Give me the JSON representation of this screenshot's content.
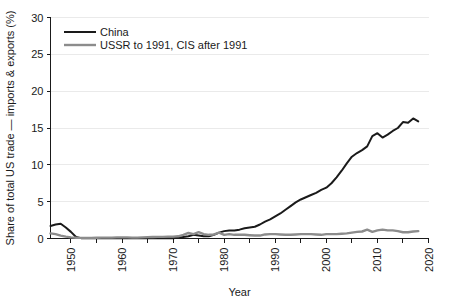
{
  "chart_data": {
    "type": "line",
    "title": "",
    "xlabel": "Year",
    "ylabel": "Share of total US trade — imports & exports (%)",
    "xlim": [
      1946,
      2020
    ],
    "ylim": [
      0,
      30
    ],
    "xticks": [
      1950,
      1960,
      1970,
      1980,
      1990,
      2000,
      2010,
      2020
    ],
    "xtick_labels": [
      "1950",
      "1960",
      "1970",
      "1980",
      "1990",
      "2000",
      "2010",
      "2020"
    ],
    "xminor_ticks": [
      1955,
      1965,
      1975,
      1985,
      1995,
      2005,
      2015
    ],
    "yticks": [
      0,
      5,
      10,
      15,
      20,
      25,
      30
    ],
    "ytick_labels": [
      "0",
      "5",
      "10",
      "15",
      "20",
      "25",
      "30"
    ],
    "grid": "y-major-faint",
    "legend_position": "top-left-inside",
    "series": [
      {
        "name": "China",
        "color": "#1a1a1a",
        "width": 2.0,
        "x": [
          1946,
          1947,
          1948,
          1949,
          1950,
          1951,
          1952,
          1953,
          1954,
          1955,
          1956,
          1957,
          1958,
          1959,
          1960,
          1961,
          1962,
          1963,
          1964,
          1965,
          1966,
          1967,
          1968,
          1969,
          1970,
          1971,
          1972,
          1973,
          1974,
          1975,
          1976,
          1977,
          1978,
          1979,
          1980,
          1981,
          1982,
          1983,
          1984,
          1985,
          1986,
          1987,
          1988,
          1989,
          1990,
          1991,
          1992,
          1993,
          1994,
          1995,
          1996,
          1997,
          1998,
          1999,
          2000,
          2001,
          2002,
          2003,
          2004,
          2005,
          2006,
          2007,
          2008,
          2009,
          2010,
          2011,
          2012,
          2013,
          2014,
          2015,
          2016,
          2017,
          2018
        ],
        "values": [
          1.7,
          1.9,
          2.0,
          1.5,
          0.9,
          0.2,
          0.05,
          0.02,
          0.02,
          0.02,
          0.02,
          0.02,
          0.02,
          0.02,
          0.02,
          0.02,
          0.02,
          0.02,
          0.02,
          0.02,
          0.02,
          0.02,
          0.02,
          0.02,
          0.05,
          0.1,
          0.2,
          0.3,
          0.5,
          0.4,
          0.3,
          0.3,
          0.5,
          0.8,
          1.0,
          1.1,
          1.1,
          1.2,
          1.4,
          1.5,
          1.6,
          1.9,
          2.3,
          2.6,
          3.0,
          3.4,
          3.9,
          4.4,
          4.9,
          5.3,
          5.6,
          5.9,
          6.2,
          6.6,
          6.9,
          7.5,
          8.3,
          9.2,
          10.2,
          11.1,
          11.6,
          12.0,
          12.5,
          13.9,
          14.3,
          13.7,
          14.1,
          14.6,
          15.0,
          15.8,
          15.7,
          16.3,
          15.9
        ]
      },
      {
        "name": "USSR to 1991, CIS after 1991",
        "color": "#8c8c8c",
        "width": 2.4,
        "x": [
          1946,
          1947,
          1948,
          1949,
          1950,
          1951,
          1952,
          1953,
          1954,
          1955,
          1956,
          1957,
          1958,
          1959,
          1960,
          1961,
          1962,
          1963,
          1964,
          1965,
          1966,
          1967,
          1968,
          1969,
          1970,
          1971,
          1972,
          1973,
          1974,
          1975,
          1976,
          1977,
          1978,
          1979,
          1980,
          1981,
          1982,
          1983,
          1984,
          1985,
          1986,
          1987,
          1988,
          1989,
          1990,
          1991,
          1992,
          1993,
          1994,
          1995,
          1996,
          1997,
          1998,
          1999,
          2000,
          2001,
          2002,
          2003,
          2004,
          2005,
          2006,
          2007,
          2008,
          2009,
          2010,
          2011,
          2012,
          2013,
          2014,
          2015,
          2016,
          2017,
          2018
        ],
        "values": [
          0.7,
          0.6,
          0.4,
          0.25,
          0.15,
          0.1,
          0.08,
          0.08,
          0.08,
          0.1,
          0.12,
          0.12,
          0.12,
          0.15,
          0.15,
          0.15,
          0.12,
          0.12,
          0.15,
          0.18,
          0.2,
          0.22,
          0.22,
          0.25,
          0.25,
          0.3,
          0.5,
          0.75,
          0.6,
          0.85,
          0.6,
          0.5,
          0.55,
          0.8,
          0.5,
          0.6,
          0.5,
          0.5,
          0.5,
          0.45,
          0.4,
          0.4,
          0.55,
          0.6,
          0.6,
          0.55,
          0.5,
          0.5,
          0.55,
          0.6,
          0.6,
          0.6,
          0.55,
          0.5,
          0.6,
          0.6,
          0.6,
          0.65,
          0.7,
          0.8,
          0.9,
          0.95,
          1.2,
          0.9,
          1.1,
          1.2,
          1.1,
          1.1,
          1.0,
          0.85,
          0.85,
          0.95,
          1.0
        ]
      }
    ]
  },
  "legend": {
    "items": [
      {
        "label": "China"
      },
      {
        "label": "USSR to 1991, CIS after 1991"
      }
    ]
  },
  "axes": {
    "x_title": "Year",
    "y_title": "Share of total US trade — imports & exports (%)"
  }
}
